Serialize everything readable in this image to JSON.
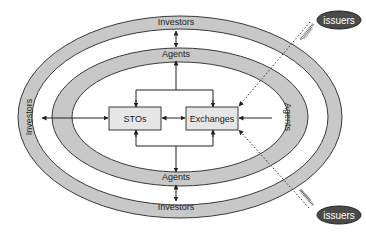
{
  "diagram": {
    "title": "",
    "rings": {
      "outer": {
        "top_label": "Investors",
        "bottom_label": "Investors",
        "left_label": "Investors"
      },
      "inner": {
        "top_label": "Agents",
        "bottom_label": "Agents",
        "right_label": "Agents"
      }
    },
    "nodes": {
      "stos": "STOs",
      "exchanges": "Exchanges",
      "issuers_top": "issuers",
      "issuers_bottom": "issuers"
    },
    "edge_labels": {
      "securities_top": "securities",
      "securities_bottom": "securities"
    },
    "colors": {
      "ring_fill": "#c8c8c8",
      "ring_stroke": "#3a3a3a",
      "box_fill": "#e6e6e6",
      "issuer_fill": "#4a4a4a",
      "issuer_text": "#ffffff",
      "line": "#222222"
    }
  }
}
